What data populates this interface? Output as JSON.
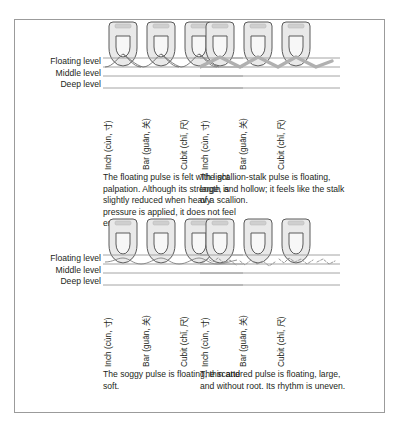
{
  "figure": {
    "levels": {
      "floating": "Floating level",
      "middle": "Middle level",
      "deep": "Deep level"
    },
    "position_labels": {
      "inch": "Inch (cùn, 寸)",
      "bar": "Bar (guān, 关)",
      "cubit": "Cubit (chǐ, 尺)"
    },
    "colors": {
      "frame": "#9b9b9b",
      "level_line": "#9a9a9a",
      "finger_outline": "#4d4d4d",
      "finger_fill": "#e8e8e8",
      "nail_fill": "#d0d0d0",
      "pulse_thin": "#5f5f5f",
      "pulse_thick": "#a8a8a8",
      "text": "#231f20"
    },
    "panels": [
      {
        "id": "floating-pulse",
        "position": "top-left",
        "pulse_name": "floating",
        "wave_style": "thin-arcs",
        "caption": "The floating pulse is felt with light palpation. Although its strength is slightly reduced when heavy pressure is applied, it does not feel empty."
      },
      {
        "id": "scallion-stalk-pulse",
        "position": "top-right",
        "pulse_name": "scallion-stalk",
        "wave_style": "thick-zigzag",
        "caption": "The scallion-stalk pulse is floating, large, and hollow; it feels like the stalk of a scallion."
      },
      {
        "id": "soggy-pulse",
        "position": "bottom-left",
        "pulse_name": "soggy",
        "wave_style": "thin-wavy",
        "caption": "The soggy pulse is floating, thin and soft."
      },
      {
        "id": "scattered-pulse",
        "position": "bottom-right",
        "pulse_name": "scattered",
        "wave_style": "irregular-dotted",
        "caption": "The scattered pulse is floating, large, and without root. Its rhythm is uneven."
      }
    ]
  }
}
